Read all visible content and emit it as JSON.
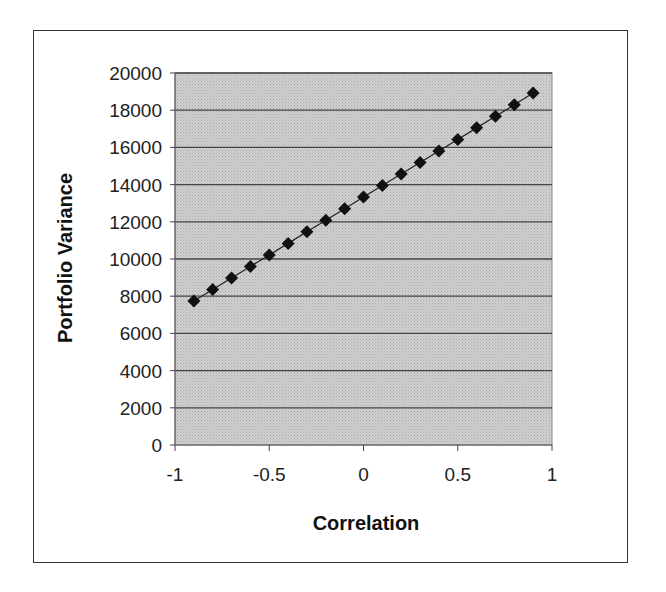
{
  "chart_data": {
    "type": "scatter",
    "title": "",
    "xlabel": "Correlation",
    "ylabel": "Portfolio Variance",
    "xlim": [
      -1,
      1
    ],
    "ylim": [
      0,
      20000
    ],
    "x_ticks": [
      "-1",
      "-0.5",
      "0",
      "0.5",
      "1"
    ],
    "y_ticks": [
      "0",
      "2000",
      "4000",
      "6000",
      "8000",
      "10000",
      "12000",
      "14000",
      "16000",
      "18000",
      "20000"
    ],
    "grid": "horizontal",
    "legend": "none",
    "marker": "diamond",
    "line": true,
    "series": [
      {
        "name": "Portfolio Variance",
        "x": [
          -0.9,
          -0.8,
          -0.7,
          -0.6,
          -0.5,
          -0.4,
          -0.3,
          -0.2,
          -0.1,
          0,
          0.1,
          0.2,
          0.3,
          0.4,
          0.5,
          0.6,
          0.7,
          0.8,
          0.9
        ],
        "values": [
          7740,
          8360,
          8980,
          9600,
          10220,
          10840,
          11460,
          12080,
          12700,
          13330,
          13950,
          14570,
          15190,
          15810,
          16430,
          17050,
          17670,
          18290,
          18920
        ]
      }
    ]
  },
  "colors": {
    "plot_bg": "#c8c8c8",
    "grid": "#444444",
    "marker": "#111111",
    "frame": "#333333"
  }
}
